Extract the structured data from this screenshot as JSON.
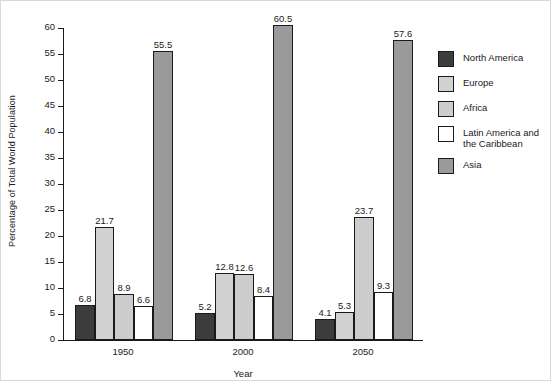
{
  "chart_data": {
    "type": "bar",
    "title": "",
    "xlabel": "Year",
    "ylabel": "Percentage of Total World Population",
    "categories": [
      "1950",
      "2000",
      "2050"
    ],
    "ylim": [
      0,
      60
    ],
    "yticks": [
      "0",
      "5",
      "10",
      "15",
      "20",
      "25",
      "30",
      "35",
      "40",
      "45",
      "50",
      "55",
      "60"
    ],
    "grid": false,
    "legend_position": "right",
    "series": [
      {
        "name": "North America",
        "color": "#3c3c3c",
        "values": [
          6.8,
          5.2,
          4.1
        ]
      },
      {
        "name": "Europe",
        "color": "#d2d2d2",
        "values": [
          21.7,
          12.8,
          5.3
        ]
      },
      {
        "name": "Africa",
        "color": "#cdcdcd",
        "values": [
          8.9,
          12.6,
          23.7
        ]
      },
      {
        "name": "Latin America and the Caribbean",
        "color": "#ffffff",
        "values": [
          6.6,
          8.4,
          9.3
        ]
      },
      {
        "name": "Asia",
        "color": "#9a9a9a",
        "values": [
          55.5,
          60.5,
          57.6
        ]
      }
    ],
    "value_labels": [
      [
        "6.8",
        "21.7",
        "8.9",
        "6.6",
        "55.5"
      ],
      [
        "5.2",
        "12.8",
        "12.6",
        "8.4",
        "60.5"
      ],
      [
        "4.1",
        "5.3",
        "23.7",
        "9.3",
        "57.6"
      ]
    ]
  },
  "legend": {
    "items": [
      {
        "label": "North America"
      },
      {
        "label": "Europe"
      },
      {
        "label": "Africa"
      },
      {
        "label": "Latin America and\nthe Caribbean"
      },
      {
        "label": "Asia"
      }
    ]
  }
}
